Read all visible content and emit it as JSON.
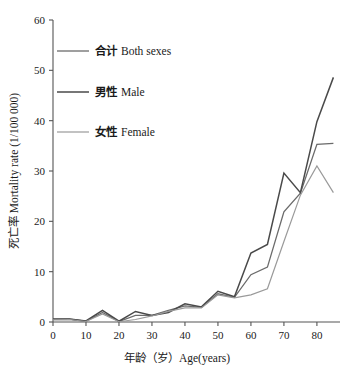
{
  "chart_data": {
    "type": "line",
    "title": "",
    "xlabel": "年龄（岁）Age(years)",
    "ylabel": "死亡率 Mortality rate (1/100 000)",
    "xlim": [
      0,
      87
    ],
    "ylim": [
      0,
      60
    ],
    "grid": false,
    "legend_position": "top-left",
    "x": [
      0,
      5,
      10,
      15,
      20,
      25,
      30,
      35,
      40,
      45,
      50,
      55,
      60,
      65,
      70,
      75,
      80,
      85
    ],
    "xticks": [
      0,
      10,
      20,
      30,
      40,
      50,
      60,
      70,
      80
    ],
    "xtick_labels": [
      "0",
      "10",
      "20",
      "30",
      "40",
      "50",
      "60",
      "70",
      "80"
    ],
    "yticks": [
      0,
      10,
      20,
      30,
      40,
      50,
      60
    ],
    "ytick_labels": [
      "0",
      "10",
      "20",
      "30",
      "40",
      "50",
      "60"
    ],
    "series": [
      {
        "name": "合计 Both sexes",
        "color": "#6b6b6b",
        "width": 1.3,
        "values": [
          0.5,
          0.55,
          0.15,
          1.9,
          0.1,
          1.3,
          1.3,
          2.3,
          3.2,
          2.9,
          5.6,
          4.9,
          9.4,
          10.9,
          21.9,
          25.6,
          35.3,
          35.5
        ]
      },
      {
        "name": "男性 Male",
        "color": "#4a4a4a",
        "width": 1.5,
        "values": [
          0.6,
          0.6,
          0.2,
          2.3,
          0.15,
          2.1,
          1.3,
          1.9,
          3.6,
          3.0,
          6.1,
          5.0,
          13.7,
          15.4,
          29.6,
          25.7,
          39.8,
          48.6
        ]
      },
      {
        "name": "女性 Female",
        "color": "#9a9a9a",
        "width": 1.2,
        "values": [
          0.45,
          0.5,
          0.1,
          1.6,
          0.05,
          0.5,
          1.2,
          2.1,
          2.8,
          2.8,
          5.4,
          4.8,
          5.4,
          6.6,
          16.0,
          25.2,
          31.0,
          25.7
        ]
      }
    ]
  },
  "axis": {
    "x_title": "年龄（岁）Age(years)",
    "y_title": "死亡率 Mortality rate (1/100 000)"
  },
  "legend": {
    "items": [
      {
        "label_cn": "合计",
        "label_en": "Both sexes",
        "color": "#6b6b6b"
      },
      {
        "label_cn": "男性",
        "label_en": "Male",
        "color": "#4a4a4a"
      },
      {
        "label_cn": "女性",
        "label_en": "Female",
        "color": "#9a9a9a"
      }
    ]
  },
  "caption": {
    "partial_text": ""
  }
}
